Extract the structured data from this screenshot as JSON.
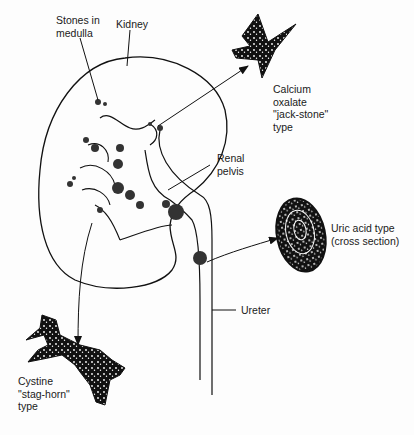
{
  "diagram": {
    "labels": {
      "stones_in_medulla": "Stones in\nmedulla",
      "kidney": "Kidney",
      "calcium_oxalate": "Calcium\noxalate\n\"jack-stone\"\ntype",
      "renal_pelvis": "Renal\npelvis",
      "uric_acid": "Uric acid type\n(cross section)",
      "ureter": "Ureter",
      "cystine": "Cystine\n\"stag-horn\"\ntype"
    },
    "colors": {
      "ink": "#111111",
      "background": "#fdfdfd"
    }
  }
}
